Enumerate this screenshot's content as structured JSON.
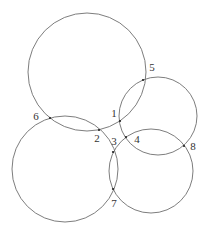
{
  "diagram": {
    "width": 206,
    "height": 234,
    "background": "#ffffff",
    "stroke_color": "#6e6e6e",
    "circles": [
      {
        "id": "top",
        "cx": 87,
        "cy": 72,
        "r": 59
      },
      {
        "id": "right-upper",
        "cx": 158,
        "cy": 116,
        "r": 39
      },
      {
        "id": "bottom-left",
        "cx": 65,
        "cy": 169,
        "r": 53
      },
      {
        "id": "bottom-right",
        "cx": 151,
        "cy": 171,
        "r": 42
      }
    ],
    "points": [
      {
        "label": "1",
        "x": 120,
        "y": 121,
        "label_x": 114,
        "label_y": 113
      },
      {
        "label": "2",
        "x": 99,
        "y": 130,
        "label_x": 97,
        "label_y": 138
      },
      {
        "label": "3",
        "x": 113,
        "y": 152,
        "label_x": 114,
        "label_y": 141
      },
      {
        "label": "4",
        "x": 126,
        "y": 137,
        "label_x": 137,
        "label_y": 139
      },
      {
        "label": "5",
        "x": 143,
        "y": 80,
        "label_x": 152,
        "label_y": 67
      },
      {
        "label": "6",
        "x": 50,
        "y": 118,
        "label_x": 36,
        "label_y": 116
      },
      {
        "label": "7",
        "x": 113,
        "y": 189,
        "label_x": 114,
        "label_y": 203
      },
      {
        "label": "8",
        "x": 184,
        "y": 146,
        "label_x": 193,
        "label_y": 146
      }
    ]
  }
}
